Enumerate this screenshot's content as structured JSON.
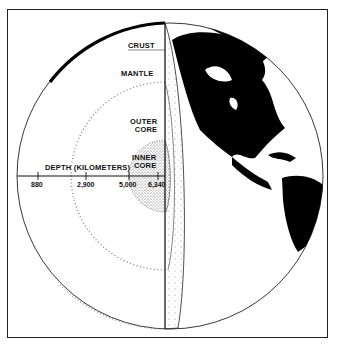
{
  "figure": {
    "type": "cutaway-globe"
  },
  "layers": [
    {
      "key": "crust",
      "label": "CRUST"
    },
    {
      "key": "mantle",
      "label": "MANTLE"
    },
    {
      "key": "outer_core",
      "label_line1": "OUTER",
      "label_line2": "CORE"
    },
    {
      "key": "inner_core",
      "label_line1": "INNER",
      "label_line2": "CORE"
    }
  ],
  "depth_axis": {
    "title": "DEPTH (KILOMETERS)",
    "ticks": [
      "880",
      "2,900",
      "5,000",
      "6,340"
    ]
  },
  "colors": {
    "ink": "#111111",
    "land": "#000000",
    "ocean": "#ffffff",
    "frame": "#222222"
  }
}
